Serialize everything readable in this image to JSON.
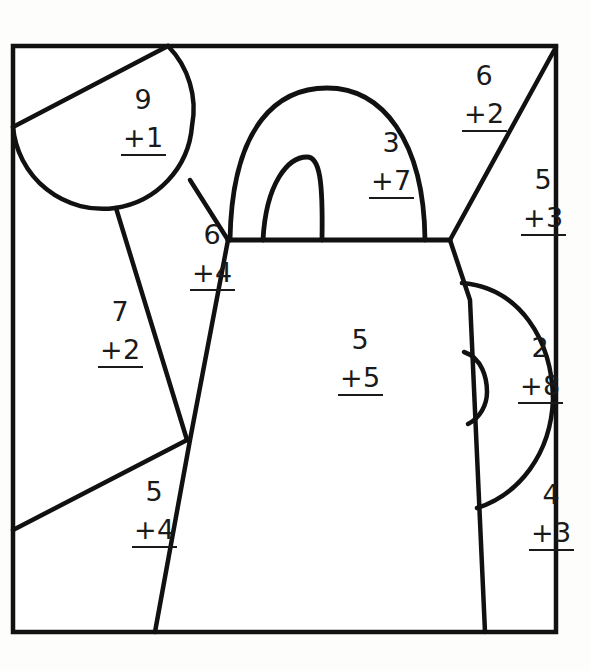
{
  "worksheet": {
    "title": "Color by Number Teapot",
    "subject": "addition-practice",
    "shape": "teapot",
    "stroke_color": "#111111",
    "fill_color": "#ffffff",
    "background_color": "#fdfdfc"
  },
  "frame": {
    "label": "picture-border",
    "left": 13,
    "top": 46,
    "right": 556,
    "bottom": 632
  },
  "regions": [
    {
      "id": "lid-circle",
      "name": "region-9-plus-1",
      "addend_top": "9",
      "addend_bottom": "+1",
      "sum": "10",
      "x": 121,
      "y": 86
    },
    {
      "id": "handle-arch",
      "name": "region-3-plus-7",
      "addend_top": "3",
      "addend_bottom": "+7",
      "sum": "10",
      "x": 369,
      "y": 129
    },
    {
      "id": "upper-right-wedge",
      "name": "region-6-plus-2",
      "addend_top": "6",
      "addend_bottom": "+2",
      "sum": "8",
      "x": 462,
      "y": 62
    },
    {
      "id": "right-side-panel",
      "name": "region-5-plus-3",
      "addend_top": "5",
      "addend_bottom": "+3",
      "sum": "8",
      "x": 521,
      "y": 166
    },
    {
      "id": "neck-left",
      "name": "region-6-plus-4",
      "addend_top": "6",
      "addend_bottom": "+4",
      "sum": "10",
      "x": 190,
      "y": 221
    },
    {
      "id": "left-panel",
      "name": "region-7-plus-2",
      "addend_top": "7",
      "addend_bottom": "+2",
      "sum": "9",
      "x": 98,
      "y": 298
    },
    {
      "id": "body-main",
      "name": "region-5-plus-5",
      "addend_top": "5",
      "addend_bottom": "+5",
      "sum": "10",
      "x": 338,
      "y": 326
    },
    {
      "id": "spout",
      "name": "region-2-plus-8",
      "addend_top": "2",
      "addend_bottom": "+8",
      "sum": "10",
      "x": 518,
      "y": 334
    },
    {
      "id": "lower-right",
      "name": "region-4-plus-3",
      "addend_top": "4",
      "addend_bottom": "+3",
      "sum": "7",
      "x": 529,
      "y": 481
    },
    {
      "id": "lower-left",
      "name": "region-5-plus-4",
      "addend_top": "5",
      "addend_bottom": "+4",
      "sum": "9",
      "x": 132,
      "y": 478
    }
  ]
}
